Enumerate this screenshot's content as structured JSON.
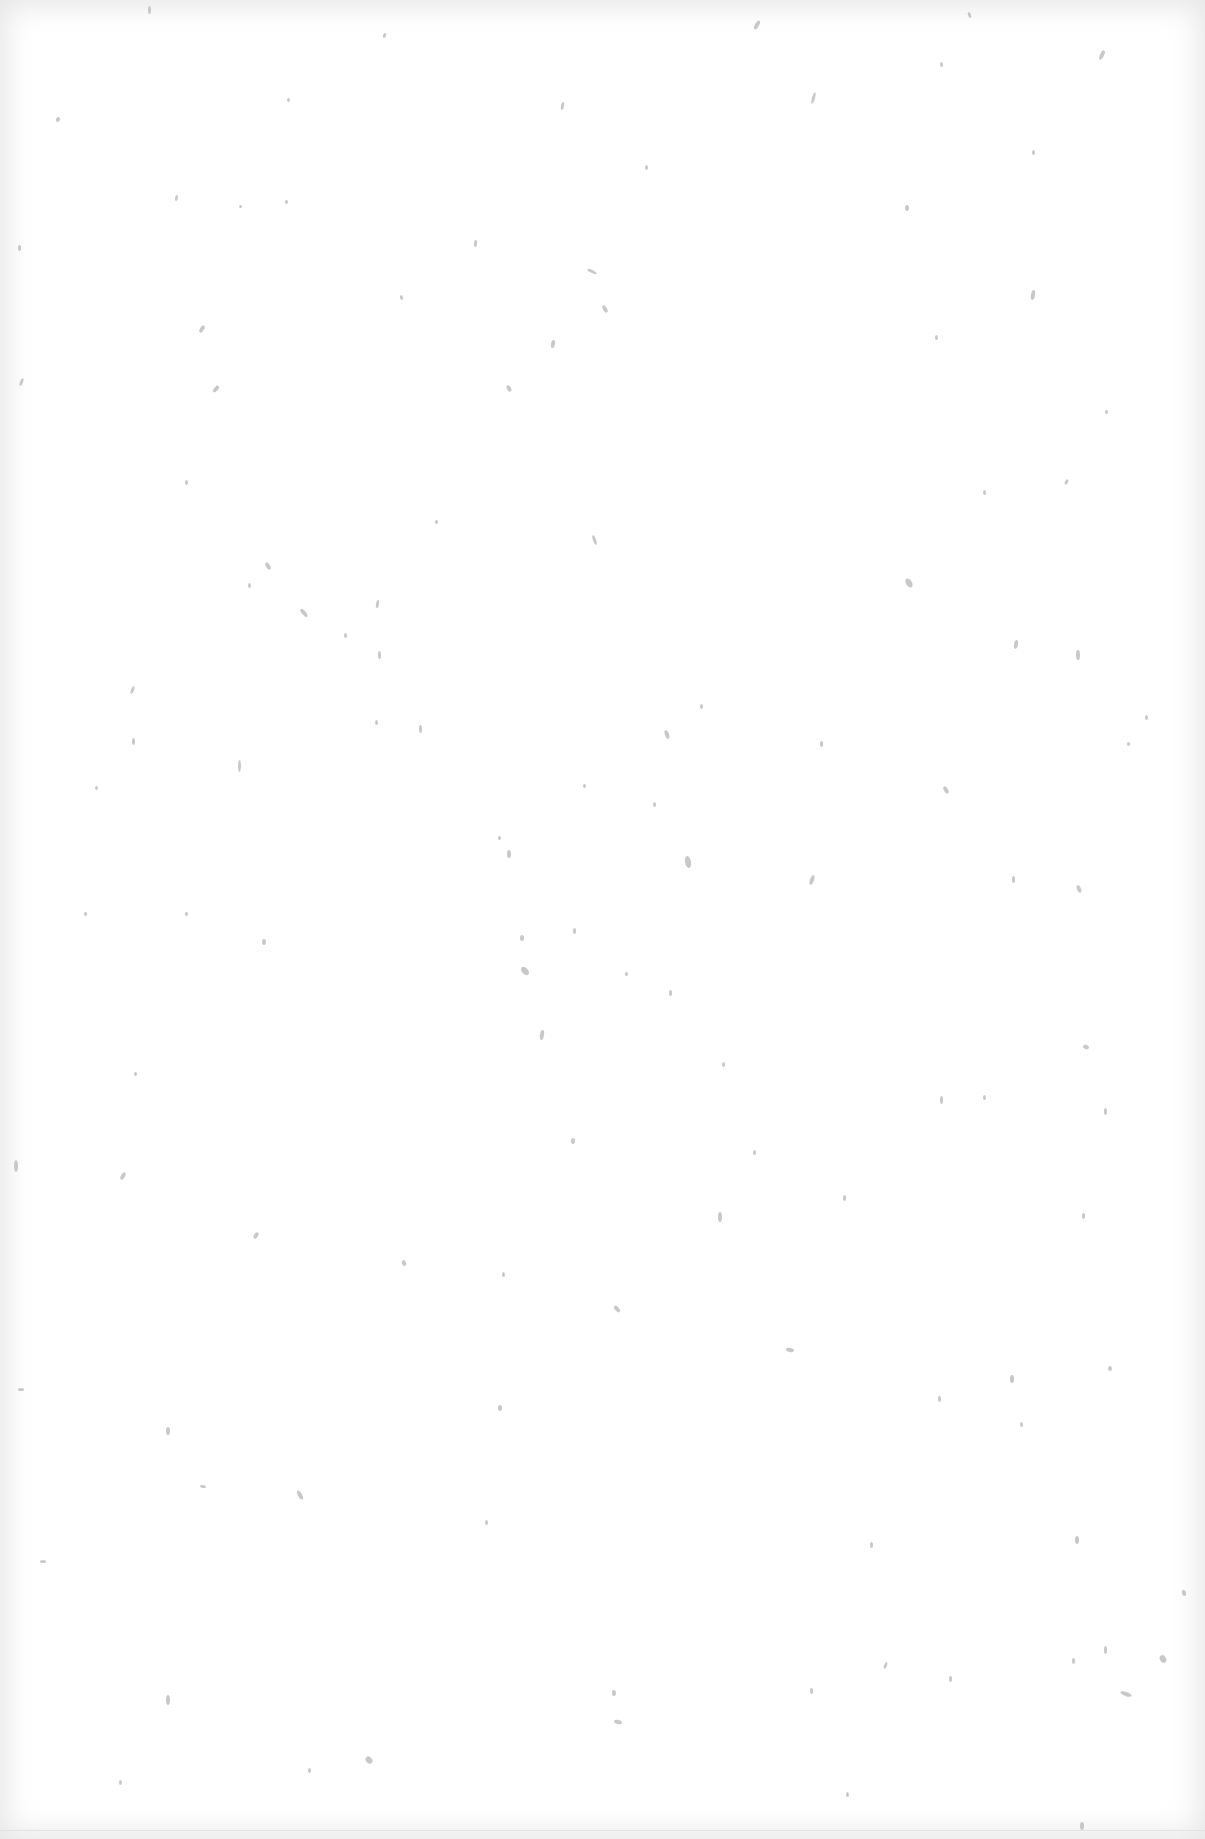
{
  "document": {
    "description": "Blank scanned page with scattered faint specks / dust marks; no legible text",
    "background_color": "#ffffff",
    "speck_color": "#9a9a9a",
    "specks": [
      [
        148,
        6,
        3,
        8,
        0
      ],
      [
        383,
        33,
        3,
        5,
        20
      ],
      [
        755,
        20,
        4,
        10,
        30
      ],
      [
        968,
        12,
        3,
        6,
        -20
      ],
      [
        1100,
        50,
        4,
        10,
        25
      ],
      [
        56,
        117,
        4,
        5,
        40
      ],
      [
        287,
        98,
        3,
        4,
        0
      ],
      [
        561,
        102,
        3,
        8,
        10
      ],
      [
        812,
        92,
        3,
        12,
        15
      ],
      [
        940,
        62,
        3,
        5,
        0
      ],
      [
        175,
        195,
        3,
        6,
        10
      ],
      [
        239,
        205,
        3,
        3,
        0
      ],
      [
        285,
        200,
        3,
        4,
        0
      ],
      [
        474,
        240,
        3,
        7,
        5
      ],
      [
        645,
        165,
        3,
        5,
        0
      ],
      [
        905,
        205,
        4,
        6,
        0
      ],
      [
        1032,
        150,
        3,
        5,
        0
      ],
      [
        18,
        245,
        3,
        6,
        0
      ],
      [
        200,
        325,
        4,
        8,
        30
      ],
      [
        400,
        295,
        3,
        5,
        -20
      ],
      [
        587,
        270,
        10,
        3,
        25
      ],
      [
        603,
        305,
        4,
        8,
        -30
      ],
      [
        1031,
        290,
        4,
        10,
        10
      ],
      [
        551,
        340,
        4,
        8,
        10
      ],
      [
        214,
        385,
        4,
        8,
        40
      ],
      [
        507,
        385,
        4,
        7,
        -30
      ],
      [
        20,
        378,
        3,
        8,
        20
      ],
      [
        935,
        335,
        3,
        5,
        0
      ],
      [
        1105,
        410,
        3,
        4,
        0
      ],
      [
        185,
        480,
        3,
        5,
        0
      ],
      [
        435,
        520,
        3,
        4,
        0
      ],
      [
        593,
        535,
        3,
        10,
        -20
      ],
      [
        983,
        490,
        3,
        5,
        0
      ],
      [
        1065,
        479,
        3,
        6,
        30
      ],
      [
        266,
        562,
        4,
        8,
        -30
      ],
      [
        248,
        583,
        3,
        5,
        0
      ],
      [
        302,
        608,
        4,
        10,
        -40
      ],
      [
        376,
        600,
        3,
        8,
        10
      ],
      [
        906,
        578,
        6,
        10,
        -30
      ],
      [
        1014,
        640,
        4,
        9,
        10
      ],
      [
        1076,
        650,
        4,
        10,
        0
      ],
      [
        131,
        686,
        3,
        8,
        20
      ],
      [
        344,
        633,
        3,
        5,
        0
      ],
      [
        378,
        651,
        3,
        8,
        0
      ],
      [
        375,
        720,
        3,
        5,
        0
      ],
      [
        419,
        725,
        3,
        8,
        0
      ],
      [
        665,
        730,
        4,
        9,
        -20
      ],
      [
        238,
        760,
        3,
        12,
        0
      ],
      [
        132,
        738,
        3,
        7,
        0
      ],
      [
        95,
        786,
        3,
        4,
        0
      ],
      [
        583,
        784,
        3,
        4,
        0
      ],
      [
        700,
        704,
        3,
        5,
        0
      ],
      [
        944,
        786,
        4,
        8,
        -30
      ],
      [
        1145,
        715,
        3,
        5,
        0
      ],
      [
        1127,
        742,
        3,
        4,
        0
      ],
      [
        820,
        741,
        3,
        6,
        0
      ],
      [
        653,
        802,
        3,
        5,
        0
      ],
      [
        507,
        850,
        4,
        8,
        0
      ],
      [
        498,
        836,
        3,
        4,
        0
      ],
      [
        685,
        856,
        6,
        12,
        -10
      ],
      [
        810,
        875,
        4,
        10,
        20
      ],
      [
        1012,
        876,
        3,
        7,
        0
      ],
      [
        1077,
        885,
        4,
        8,
        -20
      ],
      [
        185,
        912,
        3,
        4,
        0
      ],
      [
        84,
        912,
        3,
        4,
        0
      ],
      [
        262,
        939,
        4,
        6,
        0
      ],
      [
        520,
        935,
        4,
        6,
        0
      ],
      [
        573,
        928,
        3,
        6,
        0
      ],
      [
        522,
        966,
        6,
        10,
        -40
      ],
      [
        625,
        972,
        3,
        4,
        0
      ],
      [
        669,
        990,
        3,
        6,
        0
      ],
      [
        540,
        1030,
        4,
        10,
        10
      ],
      [
        722,
        1062,
        3,
        5,
        0
      ],
      [
        1083,
        1045,
        6,
        4,
        20
      ],
      [
        134,
        1072,
        3,
        4,
        0
      ],
      [
        940,
        1096,
        3,
        8,
        0
      ],
      [
        983,
        1095,
        3,
        5,
        0
      ],
      [
        1104,
        1108,
        3,
        7,
        0
      ],
      [
        14,
        1160,
        4,
        12,
        0
      ],
      [
        121,
        1172,
        4,
        8,
        30
      ],
      [
        571,
        1138,
        4,
        6,
        0
      ],
      [
        753,
        1150,
        3,
        5,
        0
      ],
      [
        718,
        1212,
        4,
        10,
        0
      ],
      [
        843,
        1195,
        3,
        6,
        0
      ],
      [
        1082,
        1213,
        3,
        6,
        0
      ],
      [
        254,
        1232,
        4,
        7,
        30
      ],
      [
        402,
        1260,
        4,
        6,
        -20
      ],
      [
        502,
        1272,
        3,
        5,
        0
      ],
      [
        615,
        1305,
        4,
        8,
        -40
      ],
      [
        786,
        1348,
        8,
        4,
        10
      ],
      [
        1010,
        1375,
        4,
        8,
        0
      ],
      [
        1108,
        1366,
        4,
        5,
        0
      ],
      [
        18,
        1388,
        6,
        3,
        0
      ],
      [
        166,
        1427,
        4,
        8,
        0
      ],
      [
        498,
        1405,
        4,
        6,
        0
      ],
      [
        938,
        1396,
        3,
        6,
        0
      ],
      [
        1020,
        1422,
        3,
        5,
        0
      ],
      [
        200,
        1485,
        6,
        3,
        10
      ],
      [
        298,
        1490,
        4,
        10,
        -30
      ],
      [
        485,
        1520,
        3,
        5,
        0
      ],
      [
        1075,
        1536,
        4,
        8,
        0
      ],
      [
        870,
        1542,
        3,
        6,
        0
      ],
      [
        40,
        1560,
        6,
        3,
        0
      ],
      [
        166,
        1695,
        4,
        10,
        0
      ],
      [
        612,
        1690,
        4,
        6,
        0
      ],
      [
        810,
        1688,
        3,
        6,
        0
      ],
      [
        884,
        1662,
        3,
        7,
        20
      ],
      [
        949,
        1676,
        3,
        6,
        0
      ],
      [
        1072,
        1658,
        3,
        6,
        0
      ],
      [
        1104,
        1646,
        3,
        8,
        0
      ],
      [
        1160,
        1655,
        6,
        8,
        -30
      ],
      [
        1120,
        1692,
        12,
        4,
        20
      ],
      [
        366,
        1756,
        6,
        8,
        -40
      ],
      [
        308,
        1768,
        3,
        5,
        0
      ],
      [
        1080,
        1822,
        4,
        8,
        0
      ],
      [
        614,
        1720,
        8,
        4,
        15
      ],
      [
        846,
        1792,
        3,
        5,
        0
      ],
      [
        119,
        1780,
        3,
        5,
        0
      ],
      [
        1182,
        1590,
        4,
        6,
        -10
      ]
    ]
  }
}
